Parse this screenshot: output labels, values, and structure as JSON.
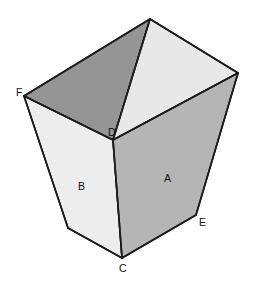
{
  "figure": {
    "type": "3d-geometric-solid",
    "shape_name": "truncated-pyramid-frustum-open-container",
    "background_color": "#ffffff",
    "edge_color": "#1c1c1c",
    "canvas": {
      "width": 255,
      "height": 284
    },
    "vertex_labels": [
      {
        "id": "F",
        "text": "F",
        "label_x": 16,
        "label_y": 96,
        "vertex_x": 24,
        "vertex_y": 96
      },
      {
        "id": "D",
        "text": "D",
        "label_x": 108,
        "label_y": 136,
        "vertex_x": 113,
        "vertex_y": 140
      },
      {
        "id": "C",
        "text": "C",
        "label_x": 119,
        "label_y": 272,
        "vertex_x": 122,
        "vertex_y": 258
      },
      {
        "id": "E",
        "text": "E",
        "label_x": 199,
        "label_y": 226,
        "vertex_x": 196,
        "vertex_y": 215
      }
    ],
    "face_labels": [
      {
        "id": "A",
        "text": "A",
        "label_x": 164,
        "label_y": 182,
        "face": "outer-right-front",
        "fill": "#b5b5b5"
      },
      {
        "id": "B",
        "text": "B",
        "label_x": 78,
        "label_y": 190,
        "face": "outer-left-front",
        "fill": "#ededed"
      }
    ],
    "faces": [
      {
        "name": "inner-back-left",
        "points": "150,19 24,96 113,140 150,19",
        "fill": "#959595",
        "description": "dark shaded inside wall at back left"
      },
      {
        "name": "inner-back-right",
        "points": "150,19 238,73 113,140 150,19",
        "fill": "#e8e8e8",
        "description": "light inside wall at back right"
      },
      {
        "name": "outer-left-front",
        "points": "24,96 113,140 122,258 68,228 24,96",
        "fill": "#ededed",
        "description": "face B, outer left trapezoidal wall"
      },
      {
        "name": "outer-right-front",
        "points": "113,140 238,73 196,215 122,258 113,140",
        "fill": "#b5b5b5",
        "description": "face A, outer right trapezoidal wall"
      }
    ],
    "edges": [
      {
        "name": "rim-apex-to-F",
        "x1": 150,
        "y1": 19,
        "x2": 24,
        "y2": 96
      },
      {
        "name": "rim-apex-to-right-corner",
        "x1": 150,
        "y1": 19,
        "x2": 238,
        "y2": 73
      },
      {
        "name": "inner-vertical-apex-to-D",
        "x1": 150,
        "y1": 19,
        "x2": 113,
        "y2": 140
      },
      {
        "name": "rim-F-to-D",
        "x1": 24,
        "y1": 96,
        "x2": 113,
        "y2": 140
      },
      {
        "name": "rim-right-corner-to-D",
        "x1": 238,
        "y1": 73,
        "x2": 113,
        "y2": 140
      },
      {
        "name": "edge-D-to-C",
        "x1": 113,
        "y1": 140,
        "x2": 122,
        "y2": 258
      },
      {
        "name": "edge-F-to-bottom-left",
        "x1": 24,
        "y1": 96,
        "x2": 68,
        "y2": 228
      },
      {
        "name": "edge-right-corner-to-E",
        "x1": 238,
        "y1": 73,
        "x2": 196,
        "y2": 215
      },
      {
        "name": "bottom-left-to-C",
        "x1": 68,
        "y1": 228,
        "x2": 122,
        "y2": 258
      },
      {
        "name": "bottom-C-to-E",
        "x1": 122,
        "y1": 258,
        "x2": 196,
        "y2": 215
      }
    ]
  }
}
